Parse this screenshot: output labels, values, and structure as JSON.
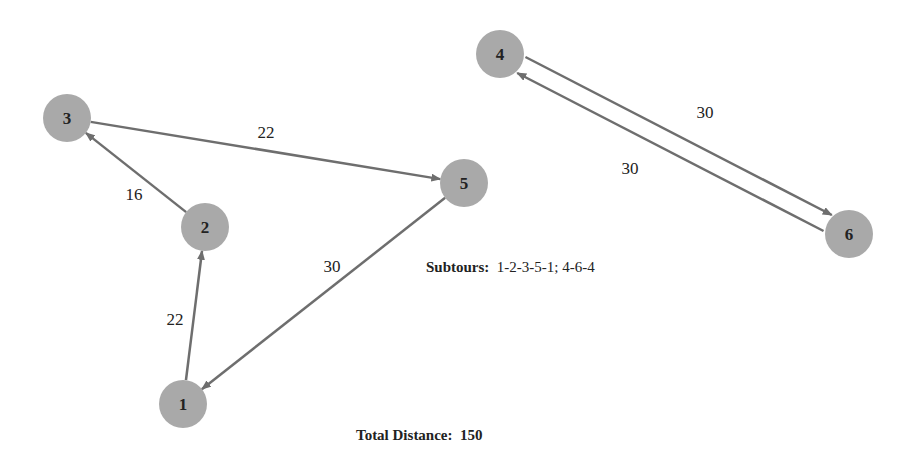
{
  "nodes": [
    {
      "id": "1",
      "x": 183,
      "y": 404
    },
    {
      "id": "2",
      "x": 205,
      "y": 227
    },
    {
      "id": "3",
      "x": 67,
      "y": 118
    },
    {
      "id": "4",
      "x": 500,
      "y": 54
    },
    {
      "id": "5",
      "x": 464,
      "y": 183
    },
    {
      "id": "6",
      "x": 849,
      "y": 234
    }
  ],
  "edges": [
    {
      "from": "1",
      "to": "2",
      "weight": "22"
    },
    {
      "from": "2",
      "to": "3",
      "weight": "16"
    },
    {
      "from": "3",
      "to": "5",
      "weight": "22"
    },
    {
      "from": "5",
      "to": "1",
      "weight": "30"
    },
    {
      "from": "4",
      "to": "6",
      "weight": "30"
    },
    {
      "from": "6",
      "to": "4",
      "weight": "30"
    }
  ],
  "subtours": {
    "label": "Subtours:",
    "value": "1-2-3-5-1; 4-6-4"
  },
  "total": {
    "label": "Total Distance:",
    "value": "150"
  }
}
